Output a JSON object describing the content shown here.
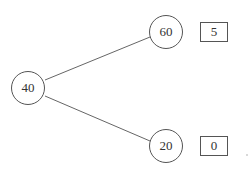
{
  "tree": {
    "root": {
      "label": "40"
    },
    "children": [
      {
        "label": "60",
        "payoff": "5"
      },
      {
        "label": "20",
        "payoff": "0"
      }
    ]
  },
  "colors": {
    "stroke": "#555555",
    "text": "#333333",
    "background": "#ffffff"
  }
}
